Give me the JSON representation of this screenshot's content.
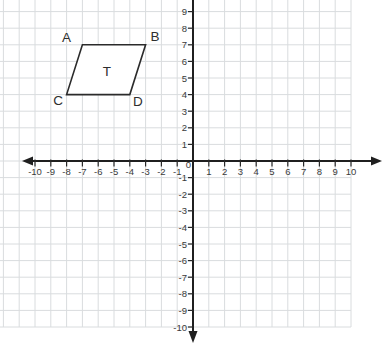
{
  "chart_data": {
    "type": "polygon",
    "title": "",
    "xlabel": "",
    "ylabel": "",
    "axes": {
      "x_min": -10,
      "x_max": 10,
      "y_min": -10,
      "y_max": 10,
      "tick_step": 1,
      "grid": true,
      "origin_label": "0",
      "x_tick_labels": [
        "-10",
        "-9",
        "-8",
        "-7",
        "-6",
        "-5",
        "-4",
        "-3",
        "-2",
        "-1",
        "1",
        "2",
        "3",
        "4",
        "5",
        "6",
        "7",
        "8",
        "9",
        "10"
      ],
      "y_tick_labels": [
        "9",
        "8",
        "7",
        "6",
        "5",
        "4",
        "3",
        "2",
        "1",
        "-1",
        "-2",
        "-3",
        "-4",
        "-5",
        "-6",
        "-7",
        "-8",
        "-9",
        "-10"
      ]
    },
    "shape": {
      "shape_type": "parallelogram",
      "shape_name": "T",
      "vertices": [
        {
          "label": "A",
          "x": -7,
          "y": 7,
          "label_offset": {
            "dx": -16,
            "dy": -7.5
          }
        },
        {
          "label": "B",
          "x": -3,
          "y": 7,
          "label_offset": {
            "dx": 9.5,
            "dy": -8
          }
        },
        {
          "label": "D",
          "x": -4,
          "y": 4,
          "label_offset": {
            "dx": 8,
            "dy": 6.5
          }
        },
        {
          "label": "C",
          "x": -8,
          "y": 4,
          "label_offset": {
            "dx": -8.5,
            "dy": 6
          }
        }
      ],
      "interior_label": {
        "text": "T",
        "x": -5.45,
        "y": 5.4
      }
    }
  },
  "colors": {
    "background": "#ffffff",
    "grid": "#d9dcde",
    "axis": "#1f1f1f",
    "tick": "#2a2a2a",
    "tick_label": "#3a3a3a",
    "shape_stroke": "#2b2b2b",
    "shape_fill": "#ffffff",
    "shape_label": "#2e2e2e"
  }
}
